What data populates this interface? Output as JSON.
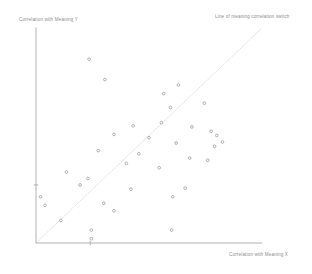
{
  "chart_data": {
    "type": "scatter",
    "title": "",
    "subtitle": "",
    "xlabel": "Correlation with Meaning X",
    "ylabel": "Correlation with Meaning Y",
    "annotations": [
      {
        "name": "diagonal-reference-line",
        "text": "Line of meaning correlation switch",
        "description": "Dotted diagonal identity line y = x running from lower-left origin to upper-right corner",
        "x1": 0.0,
        "y1": 0.0,
        "x2": 1.0,
        "y2": 1.0
      }
    ],
    "grid": false,
    "legend": null,
    "xlim": [
      0.0,
      1.0
    ],
    "ylim": [
      0.0,
      1.0
    ],
    "xticks": [
      0.24
    ],
    "yticks": [
      0.27
    ],
    "marker": "open-circle",
    "marker_color": "#9a9aa2",
    "point_count": 36,
    "points": [
      {
        "x": 0.235,
        "y": 0.855
      },
      {
        "x": 0.305,
        "y": 0.76
      },
      {
        "x": 0.63,
        "y": 0.735
      },
      {
        "x": 0.565,
        "y": 0.695
      },
      {
        "x": 0.745,
        "y": 0.65
      },
      {
        "x": 0.595,
        "y": 0.63
      },
      {
        "x": 0.555,
        "y": 0.56
      },
      {
        "x": 0.43,
        "y": 0.545
      },
      {
        "x": 0.69,
        "y": 0.54
      },
      {
        "x": 0.775,
        "y": 0.52
      },
      {
        "x": 0.8,
        "y": 0.5
      },
      {
        "x": 0.345,
        "y": 0.505
      },
      {
        "x": 0.5,
        "y": 0.49
      },
      {
        "x": 0.62,
        "y": 0.465
      },
      {
        "x": 0.825,
        "y": 0.47
      },
      {
        "x": 0.79,
        "y": 0.45
      },
      {
        "x": 0.275,
        "y": 0.43
      },
      {
        "x": 0.455,
        "y": 0.415
      },
      {
        "x": 0.68,
        "y": 0.395
      },
      {
        "x": 0.76,
        "y": 0.385
      },
      {
        "x": 0.4,
        "y": 0.37
      },
      {
        "x": 0.545,
        "y": 0.35
      },
      {
        "x": 0.135,
        "y": 0.33
      },
      {
        "x": 0.23,
        "y": 0.3
      },
      {
        "x": 0.195,
        "y": 0.27
      },
      {
        "x": 0.42,
        "y": 0.25
      },
      {
        "x": 0.66,
        "y": 0.255
      },
      {
        "x": 0.605,
        "y": 0.215
      },
      {
        "x": 0.02,
        "y": 0.215
      },
      {
        "x": 0.04,
        "y": 0.175
      },
      {
        "x": 0.3,
        "y": 0.185
      },
      {
        "x": 0.345,
        "y": 0.15
      },
      {
        "x": 0.11,
        "y": 0.105
      },
      {
        "x": 0.245,
        "y": 0.06
      },
      {
        "x": 0.6,
        "y": 0.06
      },
      {
        "x": 0.245,
        "y": 0.02
      }
    ]
  },
  "axes": {
    "x_axis_label": "Correlation with Meaning X",
    "y_axis_label": "Correlation with Meaning Y",
    "axis_color": "#a8a8ae"
  },
  "colors": {
    "background": "#ffffff",
    "axis": "#a8a8ae",
    "marker": "#9a9aa2",
    "reference_line": "#d8d8de",
    "text": "#8d8d93"
  }
}
